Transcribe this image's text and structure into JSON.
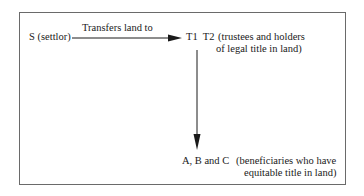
{
  "diagram": {
    "settlor": "S (settlor)",
    "transfer_label": "Transfers land to",
    "trustees": {
      "names": "T1  T2",
      "desc_line1": "(trustees and holders",
      "desc_line2": "of legal title in land)"
    },
    "beneficiaries": {
      "names": "A, B and C",
      "desc_line1": "(beneficiaries who have",
      "desc_line2": "equitable title in land)"
    },
    "colors": {
      "line": "#1a1a1a",
      "frame": "#6a6a6a"
    }
  }
}
